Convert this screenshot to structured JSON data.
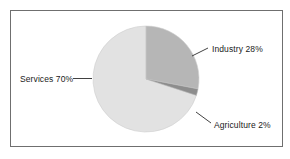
{
  "figure": {
    "background_color": "#ffffff",
    "frame_color": "#6f6f6f"
  },
  "chart_data": {
    "type": "pie",
    "title": "",
    "subtitle": "",
    "xlabel": "",
    "ylabel": "",
    "legend_position": "none",
    "grid": false,
    "labels_position": "outside-with-leader-lines",
    "start_angle_deg": 0,
    "direction": "clockwise",
    "categories": [
      "Industry",
      "Agriculture",
      "Services"
    ],
    "values": [
      28,
      2,
      70
    ],
    "units": "%",
    "slice_colors": [
      "#b6b6b6",
      "#8d8d8d",
      "#e2e2e2"
    ],
    "slice_edge_color": "#c9c9c9",
    "annotations": [
      {
        "text": "Industry 28%",
        "category": "Industry",
        "value": 28
      },
      {
        "text": "Agriculture 2%",
        "category": "Agriculture",
        "value": 2
      },
      {
        "text": "Services 70%",
        "category": "Services",
        "value": 70
      }
    ]
  },
  "labels": {
    "services": "Services 70%",
    "industry": "Industry 28%",
    "agriculture": "Agriculture 2%"
  }
}
